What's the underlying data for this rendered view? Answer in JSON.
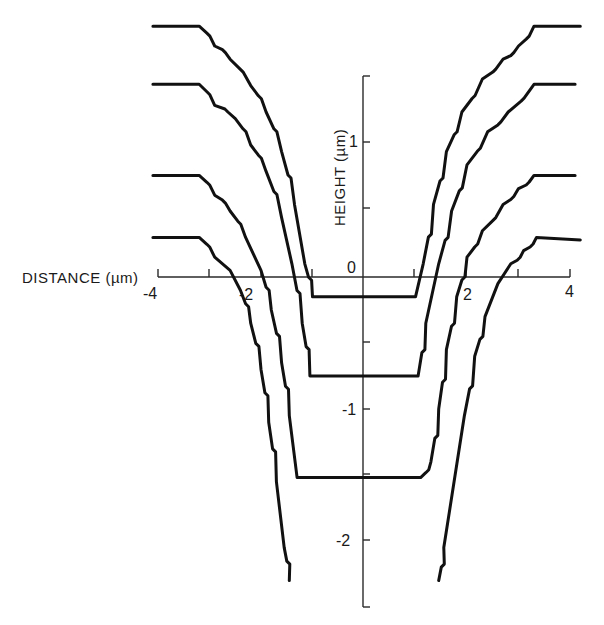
{
  "chart_data": {
    "type": "line",
    "title": "",
    "xlabel": "DISTANCE (µm)",
    "ylabel": "HEIGHT (µm)",
    "xlim": [
      -4,
      4
    ],
    "ylim": [
      -2.5,
      1.5
    ],
    "grid": false,
    "legend": "none",
    "x_ticks": [
      -4,
      -2,
      0,
      2,
      4
    ],
    "x_tick_labels": [
      "-4",
      "-2",
      "0",
      "2",
      "4"
    ],
    "x_minor_ticks": [
      -3,
      -1,
      1,
      3
    ],
    "y_ticks": [
      1,
      -1,
      -2
    ],
    "y_tick_labels": [
      "1",
      "-1",
      "-2"
    ],
    "y_minor_ticks": [
      0.5,
      -0.5,
      -1.5
    ],
    "series": [
      {
        "name": "profile-1",
        "points": [
          [
            -4.1,
            1.9
          ],
          [
            -3.2,
            1.9
          ],
          [
            -2.9,
            1.75
          ],
          [
            -2.6,
            1.65
          ],
          [
            -2.2,
            1.45
          ],
          [
            -1.9,
            1.25
          ],
          [
            -1.6,
            0.95
          ],
          [
            -1.35,
            0.55
          ],
          [
            -1.15,
            0.1
          ],
          [
            -1.0,
            -0.15
          ],
          [
            1.0,
            -0.15
          ],
          [
            1.15,
            0.1
          ],
          [
            1.35,
            0.55
          ],
          [
            1.6,
            0.95
          ],
          [
            1.9,
            1.25
          ],
          [
            2.3,
            1.5
          ],
          [
            2.7,
            1.65
          ],
          [
            3.0,
            1.75
          ],
          [
            3.3,
            1.9
          ],
          [
            4.2,
            1.9
          ]
        ]
      },
      {
        "name": "profile-2",
        "points": [
          [
            -4.1,
            1.46
          ],
          [
            -3.2,
            1.46
          ],
          [
            -2.9,
            1.3
          ],
          [
            -2.5,
            1.2
          ],
          [
            -2.2,
            1.0
          ],
          [
            -1.9,
            0.8
          ],
          [
            -1.6,
            0.45
          ],
          [
            -1.4,
            0.1
          ],
          [
            -1.2,
            -0.35
          ],
          [
            -1.05,
            -0.75
          ],
          [
            1.05,
            -0.75
          ],
          [
            1.2,
            -0.35
          ],
          [
            1.45,
            0.1
          ],
          [
            1.7,
            0.5
          ],
          [
            2.0,
            0.85
          ],
          [
            2.4,
            1.1
          ],
          [
            2.8,
            1.25
          ],
          [
            3.3,
            1.46
          ],
          [
            4.1,
            1.46
          ]
        ]
      },
      {
        "name": "profile-3",
        "points": [
          [
            -4.1,
            0.77
          ],
          [
            -3.2,
            0.77
          ],
          [
            -2.9,
            0.62
          ],
          [
            -2.6,
            0.5
          ],
          [
            -2.3,
            0.3
          ],
          [
            -2.0,
            0.05
          ],
          [
            -1.8,
            -0.25
          ],
          [
            -1.6,
            -0.65
          ],
          [
            -1.45,
            -1.05
          ],
          [
            -1.3,
            -1.52
          ],
          [
            1.1,
            -1.52
          ],
          [
            1.3,
            -1.4
          ],
          [
            1.45,
            -1.0
          ],
          [
            1.6,
            -0.55
          ],
          [
            1.8,
            -0.15
          ],
          [
            2.0,
            0.15
          ],
          [
            2.3,
            0.35
          ],
          [
            2.7,
            0.55
          ],
          [
            3.0,
            0.67
          ],
          [
            3.3,
            0.77
          ],
          [
            4.1,
            0.77
          ]
        ]
      },
      {
        "name": "profile-4",
        "points": [
          [
            -4.1,
            0.3
          ],
          [
            -3.2,
            0.3
          ],
          [
            -2.9,
            0.15
          ],
          [
            -2.6,
            0.05
          ],
          [
            -2.4,
            -0.1
          ],
          [
            -2.2,
            -0.35
          ],
          [
            -2.0,
            -0.7
          ],
          [
            -1.85,
            -1.1
          ],
          [
            -1.7,
            -1.55
          ],
          [
            -1.55,
            -2.05
          ],
          [
            -1.45,
            -2.3
          ]
        ],
        "mirror_points": [
          [
            1.45,
            -2.3
          ],
          [
            1.55,
            -2.05
          ],
          [
            1.75,
            -1.55
          ],
          [
            1.95,
            -1.05
          ],
          [
            2.15,
            -0.6
          ],
          [
            2.35,
            -0.3
          ],
          [
            2.6,
            -0.05
          ],
          [
            2.85,
            0.1
          ],
          [
            3.1,
            0.2
          ],
          [
            3.35,
            0.3
          ],
          [
            4.2,
            0.28
          ]
        ]
      }
    ]
  },
  "labels": {
    "x_axis_title": "DISTANCE (µm)",
    "y_axis_title": "HEIGHT (µm)",
    "x_tick_neg4": "-4",
    "x_tick_neg2": "-2",
    "x_tick_0": "0",
    "x_tick_2": "2",
    "x_tick_4": "4",
    "y_tick_1": "1",
    "y_tick_neg1": "-1",
    "y_tick_neg2": "-2"
  }
}
